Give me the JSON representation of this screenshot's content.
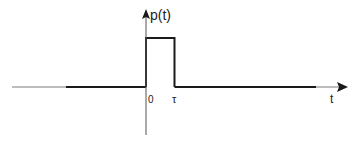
{
  "diagram": {
    "type": "rectangular-pulse",
    "y_axis_label": "p(t)",
    "x_axis_label": "t",
    "tick_labels": [
      "0",
      "τ"
    ],
    "colors": {
      "line": "#1a1a1a",
      "axis_thin": "#7a7a7a",
      "background": "#ffffff"
    }
  }
}
